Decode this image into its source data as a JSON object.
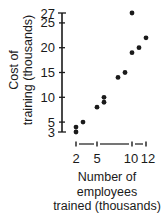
{
  "chart_data": {
    "type": "scatter",
    "title": "",
    "xlabel": "Number of employees trained (thousands)",
    "xlabel_lines": [
      "Number of",
      "employees",
      "trained (thousands)"
    ],
    "ylabel": "Cost of training (thousands)",
    "ylabel_lines": [
      "Cost of",
      "training (thousands)"
    ],
    "x_ticks": [
      2,
      5,
      10,
      12
    ],
    "y_ticks": [
      3,
      5,
      10,
      15,
      20,
      25,
      27
    ],
    "xlim": [
      2,
      12
    ],
    "ylim": [
      3,
      27
    ],
    "grid": false,
    "legend": null,
    "points": [
      {
        "x": 2,
        "y": 3
      },
      {
        "x": 2,
        "y": 4
      },
      {
        "x": 3,
        "y": 5
      },
      {
        "x": 5,
        "y": 8
      },
      {
        "x": 6,
        "y": 9
      },
      {
        "x": 6,
        "y": 10
      },
      {
        "x": 8,
        "y": 14
      },
      {
        "x": 9,
        "y": 15
      },
      {
        "x": 10,
        "y": 19
      },
      {
        "x": 11,
        "y": 20
      },
      {
        "x": 12,
        "y": 22
      },
      {
        "x": 10,
        "y": 27
      }
    ]
  },
  "style": {
    "ink": "#1a1a1a",
    "background": "#ffffff"
  }
}
